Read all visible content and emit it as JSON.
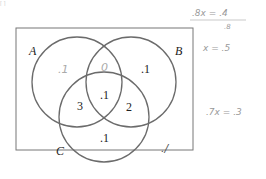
{
  "header_fragment": "[ ]",
  "diagram": {
    "type": "venn-3",
    "sets": [
      {
        "label": "A"
      },
      {
        "label": "B"
      },
      {
        "label": "C"
      }
    ],
    "regions": {
      "A_only": ".1",
      "A_and_B_only": "0",
      "B_only": ".1",
      "A_and_B_and_C": ".1",
      "A_and_C_only": ".3",
      "B_and_C_only": ".2",
      "C_only": ".1",
      "outside": ".1"
    },
    "region_display": {
      "A_only": ".1",
      "A_and_B_only": "0",
      "B_only": ".1",
      "A_and_B_and_C": ".1",
      "A_and_C_only": "3",
      "B_and_C_only": "2",
      "C_only": ".1",
      "outside": "./"
    },
    "colors": {
      "stroke": "#6b6b6b",
      "box": "#777777",
      "text": "#222222",
      "handwriting": "#9a9a9a"
    }
  },
  "annotations": {
    "line1": ".8x = .4",
    "line2": ".8",
    "line3": "x = .5",
    "line4": ".7x = .3"
  }
}
